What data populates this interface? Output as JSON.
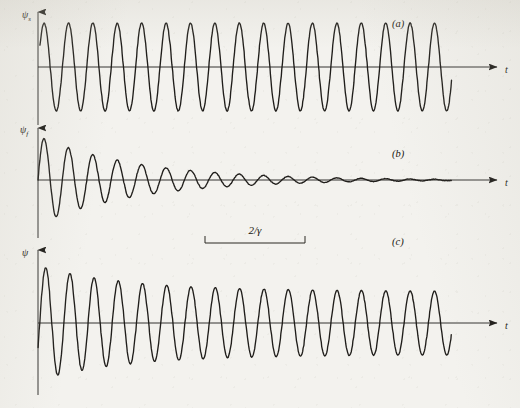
{
  "figure": {
    "background_color": "#f3f2ee",
    "ink_color": "#201e1b",
    "width": 520,
    "height": 408,
    "caption_style": "italic-parenthesized"
  },
  "annotations": {
    "measure": {
      "label": "2/γ",
      "x_start": 205,
      "x_end": 305,
      "y": 243,
      "tick_height": 7,
      "label_y": 234
    }
  },
  "panels": [
    {
      "tag": "(a)",
      "tag_x": 392,
      "tag_y": 27,
      "y_axis_label": "ψ",
      "y_axis_sub": "s",
      "y_label_x": 22,
      "y_label_y": 18,
      "x_axis_label": "t",
      "x_label_x": 505,
      "x_label_y": 73,
      "origin_x": 38,
      "baseline_y": 67,
      "axis_top_y": 12,
      "axis_right_x": 497,
      "wave_start_x": 40,
      "wave_end_x": 452,
      "amplitude": 44,
      "period_px": 24.4,
      "phase": 0,
      "envelope": "constant",
      "description": "steady-state driven oscillation, constant amplitude"
    },
    {
      "tag": "(b)",
      "tag_x": 392,
      "tag_y": 157,
      "y_axis_label": "ψ",
      "y_axis_sub": "f",
      "y_label_x": 20,
      "y_label_y": 133,
      "x_axis_label": "t",
      "x_label_x": 505,
      "x_label_y": 186,
      "origin_x": 38,
      "baseline_y": 180,
      "axis_top_y": 128,
      "axis_right_x": 497,
      "wave_start_x": 38,
      "wave_end_x": 452,
      "amplitude": 44,
      "period_px": 24.4,
      "phase": 3.1416,
      "envelope": "exponential-decay",
      "decay_length_px": 100,
      "description": "free damped transient decaying exponentially to zero"
    },
    {
      "tag": "(c)",
      "tag_x": 392,
      "tag_y": 245,
      "y_axis_label": "ψ",
      "y_axis_sub": "",
      "y_label_x": 22,
      "y_label_y": 256,
      "x_axis_label": "t",
      "x_label_x": 505,
      "x_label_y": 329,
      "origin_x": 38,
      "baseline_y": 323,
      "axis_top_y": 250,
      "axis_right_x": 497,
      "wave_start_x": 38,
      "wave_end_x": 452,
      "amplitude": 44,
      "period_px": 24.4,
      "envelope": "sum-of-a-and-b",
      "decay_length_px": 100,
      "description": "superposition of steady state and transient producing beats that settle to steady state"
    }
  ],
  "chart_data": {
    "type": "line",
    "title": "",
    "xlabel": "t",
    "ylabel": "ψ",
    "grid": false,
    "legend": "none",
    "series": [
      {
        "name": "(a) steady-state driven response",
        "ylabel": "ψ_s",
        "form": "A*sin(omega*t)",
        "amplitude": 1.0,
        "periods_visible": 17,
        "decays": false
      },
      {
        "name": "(b) free damped transient",
        "ylabel": "ψ_f",
        "form": "-A*exp(-gamma*t/2)*sin(omega*t)",
        "amplitude": 1.0,
        "periods_visible": 17,
        "decays": true,
        "decay_marker": "2/γ"
      },
      {
        "name": "(c) total response = (a) + (b)",
        "ylabel": "ψ",
        "form": "A*sin(omega*t) - A*exp(-gamma*t/2)*sin(omega*t)",
        "amplitude": 1.0,
        "periods_visible": 17,
        "decays": false,
        "note": "beats during transient, settles to steady state"
      }
    ]
  }
}
